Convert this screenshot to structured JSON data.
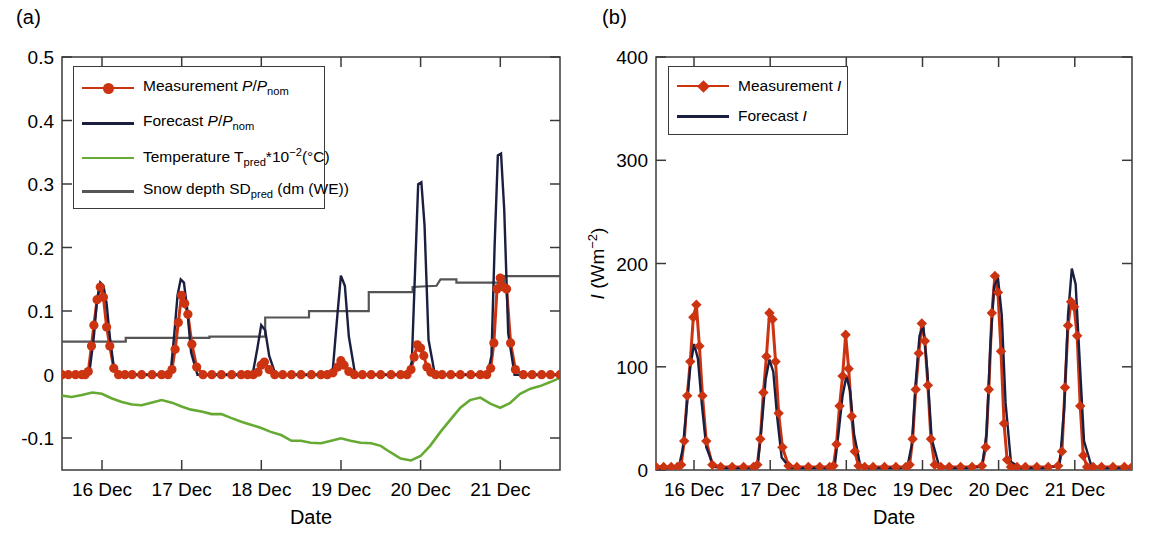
{
  "figure": {
    "panel_a_label": "(a)",
    "panel_b_label": "(b)"
  },
  "panel_a": {
    "xlabel": "Date",
    "legend": [
      {
        "name": "measurement-power",
        "label_plain": "Measurement P/Pnom",
        "style": "line-marker",
        "color": "#cc3311",
        "marker": "circle"
      },
      {
        "name": "forecast-power",
        "label_plain": "Forecast P/Pnom",
        "style": "line",
        "color": "#1a1f40",
        "marker": "none"
      },
      {
        "name": "temperature",
        "label_plain": "Temperature Tpred*10-2(°C)",
        "style": "line",
        "color": "#66aa33",
        "marker": "none"
      },
      {
        "name": "snow-depth",
        "label_plain": "Snow depth SDpred (dm (WE))",
        "style": "line",
        "color": "#555555",
        "marker": "none"
      }
    ],
    "ytick_labels": [
      "0.5",
      "0.4",
      "0.3",
      "0.2",
      "0.1",
      "0",
      "-0.1"
    ],
    "xtick_labels": [
      "16 Dec",
      "17 Dec",
      "18 Dec",
      "19 Dec",
      "20 Dec",
      "21 Dec"
    ]
  },
  "panel_b": {
    "xlabel": "Date",
    "ylabel_plain": "I (Wm-2)",
    "legend": [
      {
        "name": "measurement-irradiance",
        "label_plain": "Measurement I",
        "style": "line-marker",
        "color": "#cc3311",
        "marker": "diamond"
      },
      {
        "name": "forecast-irradiance",
        "label_plain": "Forecast I",
        "style": "line",
        "color": "#1a1f40",
        "marker": "none"
      }
    ],
    "ytick_labels": [
      "400",
      "300",
      "200",
      "100",
      "0"
    ],
    "xtick_labels": [
      "16 Dec",
      "17 Dec",
      "18 Dec",
      "19 Dec",
      "20 Dec",
      "21 Dec"
    ]
  },
  "chart_data": [
    {
      "type": "line",
      "panel": "(a)",
      "title": "",
      "xlabel": "Date",
      "ylabel": "P/P_nom",
      "xlim": [
        15.5,
        21.75
      ],
      "ylim": [
        -0.15,
        0.5
      ],
      "yticks": [
        -0.1,
        0,
        0.1,
        0.2,
        0.3,
        0.4,
        0.5
      ],
      "xticks": [
        16,
        17,
        18,
        19,
        20,
        21
      ],
      "xtick_labels": [
        "16 Dec",
        "17 Dec",
        "18 Dec",
        "19 Dec",
        "20 Dec",
        "21 Dec"
      ],
      "grid": false,
      "legend_position": "upper-left",
      "series": [
        {
          "name": "Measurement P/Pnom",
          "color": "#cc3311",
          "marker": "circle",
          "x": [
            15.5,
            15.58,
            15.67,
            15.75,
            15.79,
            15.83,
            15.87,
            15.9,
            15.94,
            15.98,
            16.02,
            16.06,
            16.1,
            16.15,
            16.21,
            16.29,
            16.38,
            16.5,
            16.63,
            16.75,
            16.83,
            16.88,
            16.92,
            16.96,
            17.0,
            17.04,
            17.08,
            17.13,
            17.19,
            17.27,
            17.38,
            17.5,
            17.63,
            17.75,
            17.83,
            17.9,
            17.96,
            18.0,
            18.04,
            18.1,
            18.17,
            18.27,
            18.38,
            18.5,
            18.63,
            18.75,
            18.83,
            18.9,
            18.96,
            19.0,
            19.04,
            19.1,
            19.17,
            19.27,
            19.38,
            19.5,
            19.63,
            19.75,
            19.83,
            19.88,
            19.92,
            19.96,
            20.0,
            20.04,
            20.08,
            20.13,
            20.19,
            20.27,
            20.38,
            20.5,
            20.63,
            20.75,
            20.83,
            20.88,
            20.92,
            20.96,
            21.0,
            21.04,
            21.08,
            21.13,
            21.19,
            21.29,
            21.4,
            21.52,
            21.63,
            21.75
          ],
          "y": [
            0,
            0,
            0,
            0,
            0,
            0.005,
            0.045,
            0.078,
            0.118,
            0.138,
            0.122,
            0.075,
            0.045,
            0.01,
            0,
            0,
            0,
            0,
            0,
            0,
            0,
            0.008,
            0.04,
            0.082,
            0.125,
            0.112,
            0.095,
            0.048,
            0.012,
            0,
            0,
            0,
            0,
            0,
            0,
            0,
            0.004,
            0.015,
            0.02,
            0.008,
            0,
            0,
            0,
            0,
            0,
            0,
            0,
            0.003,
            0.012,
            0.022,
            0.015,
            0.005,
            0,
            0,
            0,
            0,
            0,
            0,
            0,
            0.008,
            0.028,
            0.047,
            0.042,
            0.03,
            0.012,
            0.004,
            0,
            0,
            0,
            0,
            0,
            0,
            0,
            0.01,
            0.05,
            0.135,
            0.152,
            0.138,
            0.135,
            0.05,
            0.008,
            0,
            0,
            0,
            0,
            0,
            0
          ]
        },
        {
          "name": "Forecast P/Pnom",
          "color": "#1a1f40",
          "marker": "none",
          "x": [
            15.5,
            15.7,
            15.8,
            15.85,
            15.9,
            15.94,
            15.98,
            16.02,
            16.06,
            16.1,
            16.15,
            16.22,
            16.32,
            16.5,
            16.72,
            16.82,
            16.87,
            16.91,
            16.95,
            16.99,
            17.03,
            17.07,
            17.12,
            17.2,
            17.32,
            17.5,
            17.72,
            17.84,
            17.9,
            17.95,
            18.0,
            18.05,
            18.1,
            18.18,
            18.3,
            18.5,
            18.72,
            18.84,
            18.9,
            18.95,
            19.0,
            19.05,
            19.1,
            19.18,
            19.3,
            19.5,
            19.72,
            19.84,
            19.89,
            19.93,
            19.97,
            20.01,
            20.05,
            20.1,
            20.18,
            20.3,
            20.5,
            20.72,
            20.84,
            20.89,
            20.93,
            20.97,
            21.01,
            21.05,
            21.1,
            21.18,
            21.3,
            21.5,
            21.75
          ],
          "y": [
            0,
            0,
            0,
            0.01,
            0.06,
            0.118,
            0.145,
            0.14,
            0.112,
            0.06,
            0.012,
            0,
            0,
            0,
            0,
            0,
            0.012,
            0.065,
            0.125,
            0.15,
            0.145,
            0.105,
            0.035,
            0,
            0,
            0,
            0,
            0,
            0.006,
            0.04,
            0.078,
            0.07,
            0.03,
            0,
            0,
            0,
            0,
            0,
            0.01,
            0.085,
            0.156,
            0.14,
            0.06,
            0,
            0,
            0,
            0,
            0,
            0.02,
            0.16,
            0.3,
            0.303,
            0.235,
            0.055,
            0,
            0,
            0,
            0,
            0,
            0.03,
            0.205,
            0.345,
            0.348,
            0.26,
            0.065,
            0,
            0,
            0,
            0
          ]
        },
        {
          "name": "Temperature Tpred*10^-2 (degC)",
          "color": "#66aa33",
          "marker": "none",
          "x": [
            15.5,
            15.62,
            15.75,
            15.88,
            16.0,
            16.12,
            16.25,
            16.38,
            16.5,
            16.62,
            16.75,
            16.88,
            17.0,
            17.12,
            17.25,
            17.38,
            17.5,
            17.62,
            17.75,
            17.88,
            18.0,
            18.12,
            18.25,
            18.38,
            18.5,
            18.62,
            18.75,
            18.88,
            19.0,
            19.12,
            19.25,
            19.38,
            19.5,
            19.62,
            19.75,
            19.88,
            20.0,
            20.12,
            20.25,
            20.38,
            20.5,
            20.62,
            20.75,
            20.88,
            21.0,
            21.12,
            21.25,
            21.38,
            21.5,
            21.62,
            21.75
          ],
          "y": [
            -0.033,
            -0.035,
            -0.032,
            -0.028,
            -0.03,
            -0.037,
            -0.043,
            -0.047,
            -0.048,
            -0.044,
            -0.04,
            -0.044,
            -0.05,
            -0.055,
            -0.058,
            -0.062,
            -0.062,
            -0.068,
            -0.074,
            -0.079,
            -0.084,
            -0.09,
            -0.095,
            -0.104,
            -0.104,
            -0.107,
            -0.108,
            -0.104,
            -0.1,
            -0.104,
            -0.107,
            -0.108,
            -0.112,
            -0.122,
            -0.132,
            -0.135,
            -0.128,
            -0.112,
            -0.09,
            -0.07,
            -0.052,
            -0.04,
            -0.036,
            -0.046,
            -0.052,
            -0.045,
            -0.03,
            -0.022,
            -0.018,
            -0.012,
            -0.005
          ]
        },
        {
          "name": "Snow depth SDpred (dm WE)",
          "color": "#555555",
          "marker": "none",
          "x": [
            15.5,
            16.3,
            16.3,
            17.35,
            17.35,
            18.05,
            18.05,
            18.6,
            18.6,
            19.35,
            19.35,
            19.9,
            19.9,
            20.2,
            20.25,
            20.45,
            20.45,
            21.05,
            21.05,
            21.75
          ],
          "y": [
            0.052,
            0.052,
            0.058,
            0.058,
            0.06,
            0.06,
            0.09,
            0.09,
            0.1,
            0.1,
            0.13,
            0.13,
            0.138,
            0.14,
            0.15,
            0.15,
            0.145,
            0.145,
            0.155,
            0.155
          ]
        }
      ]
    },
    {
      "type": "line",
      "panel": "(b)",
      "title": "",
      "xlabel": "Date",
      "ylabel": "I (Wm^-2)",
      "xlim": [
        15.5,
        21.75
      ],
      "ylim": [
        0,
        400
      ],
      "yticks": [
        0,
        100,
        200,
        300,
        400
      ],
      "xticks": [
        16,
        17,
        18,
        19,
        20,
        21
      ],
      "xtick_labels": [
        "16 Dec",
        "17 Dec",
        "18 Dec",
        "19 Dec",
        "20 Dec",
        "21 Dec"
      ],
      "grid": false,
      "legend_position": "upper-left",
      "series": [
        {
          "name": "Measurement I",
          "color": "#cc3311",
          "marker": "diamond",
          "x": [
            15.5,
            15.6,
            15.7,
            15.78,
            15.83,
            15.87,
            15.91,
            15.95,
            15.99,
            16.03,
            16.07,
            16.11,
            16.16,
            16.24,
            16.35,
            16.5,
            16.65,
            16.78,
            16.83,
            16.87,
            16.91,
            16.95,
            16.99,
            17.03,
            17.07,
            17.11,
            17.16,
            17.24,
            17.35,
            17.5,
            17.65,
            17.78,
            17.83,
            17.87,
            17.91,
            17.95,
            17.99,
            18.03,
            18.07,
            18.11,
            18.16,
            18.24,
            18.35,
            18.5,
            18.65,
            18.78,
            18.83,
            18.87,
            18.91,
            18.95,
            18.99,
            19.03,
            19.07,
            19.11,
            19.16,
            19.24,
            19.35,
            19.5,
            19.65,
            19.78,
            19.83,
            19.87,
            19.91,
            19.95,
            19.99,
            20.03,
            20.07,
            20.11,
            20.16,
            20.24,
            20.35,
            20.5,
            20.65,
            20.78,
            20.83,
            20.87,
            20.91,
            20.95,
            20.99,
            21.03,
            21.07,
            21.11,
            21.16,
            21.24,
            21.35,
            21.5,
            21.65,
            21.75
          ],
          "y": [
            3,
            3,
            3,
            3,
            5,
            28,
            72,
            105,
            148,
            160,
            120,
            72,
            28,
            5,
            3,
            3,
            3,
            3,
            5,
            30,
            75,
            110,
            152,
            146,
            105,
            55,
            22,
            4,
            3,
            3,
            3,
            3,
            4,
            25,
            62,
            91,
            131,
            98,
            52,
            18,
            4,
            3,
            3,
            3,
            3,
            3,
            5,
            30,
            78,
            113,
            142,
            125,
            82,
            30,
            5,
            3,
            3,
            3,
            3,
            4,
            22,
            78,
            152,
            188,
            172,
            115,
            45,
            10,
            3,
            3,
            3,
            3,
            3,
            4,
            18,
            80,
            140,
            163,
            158,
            130,
            62,
            14,
            3,
            3,
            3,
            3,
            3,
            3
          ]
        },
        {
          "name": "Forecast I",
          "color": "#1a1f40",
          "marker": "none",
          "x": [
            15.5,
            15.72,
            15.8,
            15.85,
            15.9,
            15.95,
            16.0,
            16.05,
            16.1,
            16.16,
            16.26,
            16.4,
            16.6,
            16.78,
            16.84,
            16.89,
            16.94,
            16.99,
            17.04,
            17.09,
            17.15,
            17.26,
            17.4,
            17.6,
            17.78,
            17.85,
            17.9,
            17.95,
            18.0,
            18.05,
            18.1,
            18.18,
            18.3,
            18.5,
            18.7,
            18.8,
            18.86,
            18.91,
            18.96,
            19.01,
            19.06,
            19.12,
            19.22,
            19.38,
            19.58,
            19.78,
            19.84,
            19.89,
            19.94,
            19.99,
            20.04,
            20.09,
            20.16,
            20.28,
            20.45,
            20.65,
            20.8,
            20.86,
            20.91,
            20.96,
            21.01,
            21.06,
            21.12,
            21.22,
            21.38,
            21.58,
            21.75
          ],
          "y": [
            2,
            2,
            3,
            20,
            58,
            100,
            122,
            108,
            65,
            22,
            3,
            2,
            2,
            2,
            8,
            45,
            88,
            107,
            95,
            52,
            12,
            2,
            2,
            2,
            2,
            6,
            38,
            72,
            91,
            76,
            35,
            5,
            2,
            2,
            2,
            3,
            25,
            85,
            130,
            140,
            98,
            30,
            3,
            2,
            2,
            3,
            35,
            120,
            178,
            186,
            150,
            65,
            8,
            2,
            2,
            2,
            5,
            60,
            150,
            195,
            180,
            110,
            28,
            3,
            2,
            2,
            2
          ]
        }
      ]
    }
  ]
}
